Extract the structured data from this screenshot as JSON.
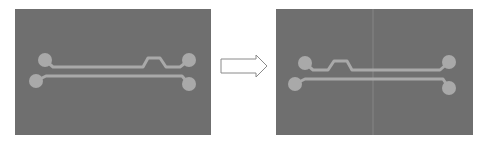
{
  "diagram": {
    "type": "before-after-pcb-trace-routing",
    "colors": {
      "background": "#ffffff",
      "board": "#6f6f6f",
      "trace": "#a9a9a9",
      "pad": "#a9a9a9",
      "seam": "#7e7e7e",
      "arrow_stroke": "#8a8a8a",
      "arrow_fill": "#ffffff"
    },
    "panels": [
      {
        "id": "before",
        "x": 15,
        "y": 9,
        "width": 196,
        "height": 126,
        "pads": [
          {
            "id": "top-left",
            "cx": 45,
            "cy": 60,
            "r": 7
          },
          {
            "id": "top-right",
            "cx": 189,
            "cy": 60,
            "r": 7
          },
          {
            "id": "bottom-left",
            "cx": 36,
            "cy": 81,
            "r": 7
          },
          {
            "id": "bottom-right",
            "cx": 189,
            "cy": 84,
            "r": 7
          }
        ],
        "traces": [
          {
            "id": "top-trace",
            "points": "45,60 53,67 143,67 148,58 160,58 166,67 180,67 189,60"
          },
          {
            "id": "bottom-trace",
            "points": "36,81 46,76 182,76 189,84"
          }
        ],
        "seam": null
      },
      {
        "id": "after",
        "x": 276,
        "y": 9,
        "width": 197,
        "height": 126,
        "pads": [
          {
            "id": "top-left",
            "cx": 305,
            "cy": 63,
            "r": 7
          },
          {
            "id": "top-right",
            "cx": 449,
            "cy": 62,
            "r": 7
          },
          {
            "id": "bottom-left",
            "cx": 295,
            "cy": 84,
            "r": 7
          },
          {
            "id": "bottom-right",
            "cx": 449,
            "cy": 88,
            "r": 7
          }
        ],
        "traces": [
          {
            "id": "top-trace",
            "points": "305,63 313,70 328,70 334,61 347,61 352,70 440,70 449,62"
          },
          {
            "id": "bottom-trace",
            "points": "295,84 305,79 443,79 449,88"
          }
        ],
        "seam": {
          "x": 373
        }
      }
    ],
    "arrow": {
      "points": "221,59 256,59 256,55 267,66 256,77 256,73 221,73"
    }
  }
}
